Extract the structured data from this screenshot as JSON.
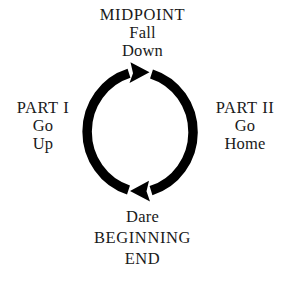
{
  "diagram": {
    "title_top": "MIDPOINT",
    "top_label": {
      "line1": "MIDPOINT",
      "line2": "Fall",
      "line3": "Down"
    },
    "left_label": {
      "line1": "PART I",
      "line2": "Go",
      "line3": "Up"
    },
    "right_label": {
      "line1": "PART II",
      "line2": "Go",
      "line3": "Home"
    },
    "bottom_label": {
      "line1": "Dare",
      "line2": "BEGINNING",
      "line3": "END"
    },
    "shape": {
      "type": "cycle-circle",
      "direction": "clockwise",
      "arrow_top": "arrow-right",
      "arrow_bottom": "arrow-left",
      "stroke_color": "#000000",
      "background_color": "#ffffff",
      "text_color": "#1a1a1a"
    }
  }
}
